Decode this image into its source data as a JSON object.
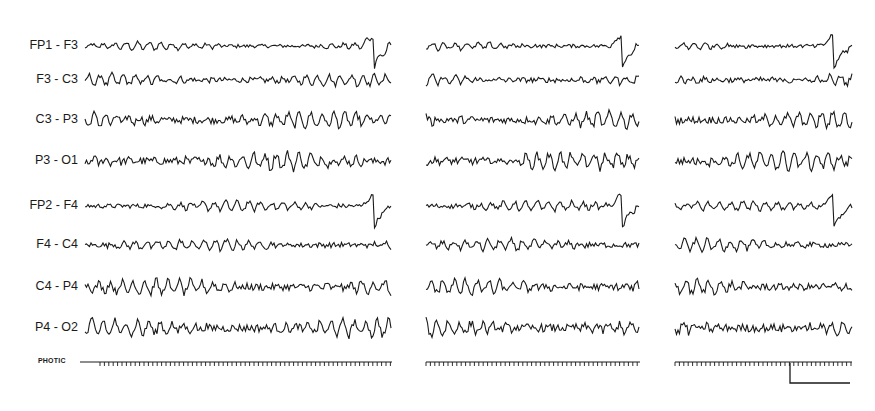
{
  "figure": {
    "type": "eeg-tracing",
    "channels": [
      {
        "label": "FP1 - F3",
        "y": 46,
        "amp": 4,
        "artifact": true
      },
      {
        "label": "F3 - C3",
        "y": 80,
        "amp": 6,
        "artifact": false
      },
      {
        "label": "C3 - P3",
        "y": 120,
        "amp": 8,
        "artifact": false
      },
      {
        "label": "P3 - O1",
        "y": 161,
        "amp": 9,
        "artifact": false
      },
      {
        "label": "FP2 - F4",
        "y": 206,
        "amp": 5,
        "artifact": true
      },
      {
        "label": "F4 - C4",
        "y": 245,
        "amp": 6,
        "artifact": false
      },
      {
        "label": "C4 - P4",
        "y": 287,
        "amp": 8,
        "artifact": false
      },
      {
        "label": "P4 - O2",
        "y": 328,
        "amp": 9,
        "artifact": false
      }
    ],
    "photic_label": "PHOTIC",
    "photic_y": 362,
    "panels": [
      {
        "x0": 85,
        "x1": 392
      },
      {
        "x0": 426,
        "x1": 640
      },
      {
        "x0": 675,
        "x1": 852
      }
    ],
    "scale_bar": {
      "x": 790,
      "y": 383,
      "width": 60,
      "height": 20
    },
    "trace_color": "#1a1a1a"
  }
}
